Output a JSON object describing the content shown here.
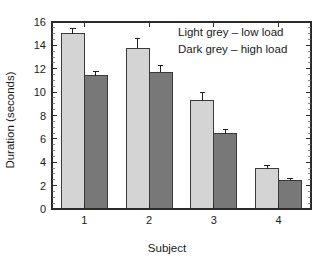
{
  "chart_data": {
    "type": "bar",
    "title": "",
    "subtitle": "",
    "xlabel": "Subject",
    "ylabel": "Duration (seconds)",
    "categories": [
      "1",
      "2",
      "3",
      "4"
    ],
    "series": [
      {
        "name": "Light grey – low load",
        "color": "#d4d4d4",
        "values": [
          15.0,
          13.75,
          9.25,
          3.45
        ],
        "errors": [
          0.45,
          0.85,
          0.75,
          0.3
        ]
      },
      {
        "name": "Dark grey – high load",
        "color": "#787878",
        "values": [
          11.4,
          11.7,
          6.45,
          2.45
        ],
        "errors": [
          0.35,
          0.6,
          0.35,
          0.18
        ]
      }
    ],
    "ylim": [
      0,
      16
    ],
    "y_major_ticks": [
      0,
      2,
      4,
      6,
      8,
      10,
      12,
      14,
      16
    ],
    "y_tick_labels": [
      "0",
      "2",
      "4",
      "6",
      "8",
      "10",
      "12",
      "14",
      "16"
    ],
    "y_minor_interval": 0.5,
    "x_tick_labels": [
      "1",
      "2",
      "3",
      "4"
    ],
    "grid": false,
    "legend_position": "top-right-text",
    "frame": true,
    "annotations": [
      "Light grey – low load",
      "Dark grey – high load"
    ]
  },
  "legend": {
    "line1": "Light grey – low load",
    "line2": "Dark grey – high load"
  },
  "axes": {
    "y_title": "Duration (seconds)",
    "x_title": "Subject"
  },
  "colors": {
    "light_bar": "#d4d4d4",
    "dark_bar": "#787878",
    "bar_outline": "#3a3a3a",
    "axis": "#2b2b2b",
    "text": "#1a1a1a",
    "background": "#ffffff"
  }
}
